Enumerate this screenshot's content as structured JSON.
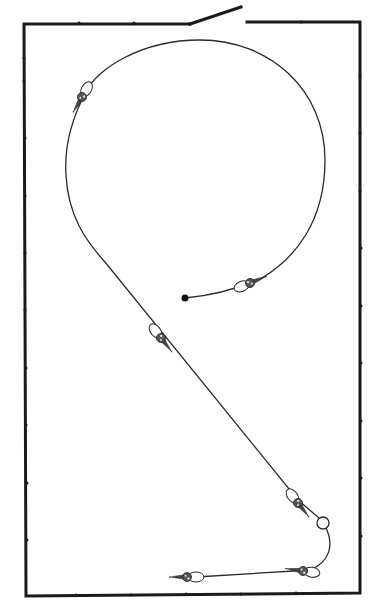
{
  "diagram": {
    "type": "line-art illustration",
    "frame": {
      "stroke_color": "#1a1a1a",
      "left": 24,
      "top": 24,
      "right": 360,
      "bottom": 596,
      "gap_switch": {
        "start_x": 190,
        "start_y": 24,
        "end_x": 241,
        "end_y": 6,
        "gap_end_x": 247
      }
    },
    "path": {
      "stroke_color": "#2a2a2a",
      "start_dot": {
        "x": 185,
        "y": 298,
        "color": "#111111"
      },
      "end_ring": {
        "x": 323,
        "y": 523,
        "r": 6
      }
    },
    "connectors": [
      {
        "id": "connector-1",
        "x": 82,
        "y": 93,
        "angle": 120
      },
      {
        "id": "connector-2",
        "x": 250,
        "y": 282,
        "angle": -20
      },
      {
        "id": "connector-3",
        "x": 160,
        "y": 335,
        "angle": 55
      },
      {
        "id": "connector-4",
        "x": 297,
        "y": 501,
        "angle": 55
      },
      {
        "id": "connector-5",
        "x": 303,
        "y": 571,
        "angle": -165
      },
      {
        "id": "connector-6",
        "x": 186,
        "y": 577,
        "angle": 180
      }
    ],
    "colors": {
      "background": "#ffffff",
      "ink": "#1a1a1a"
    }
  }
}
